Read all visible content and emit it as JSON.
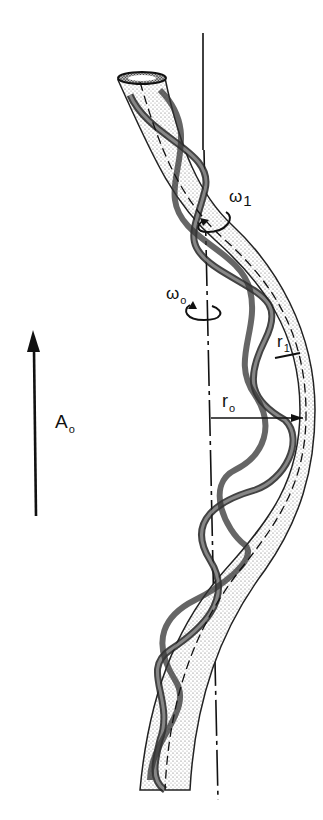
{
  "figure": {
    "labels": {
      "omega1": {
        "symbol": "ω",
        "subscript": "1"
      },
      "omega0": {
        "symbol": "ω",
        "subscript": "o"
      },
      "r1": {
        "symbol": "r",
        "subscript": "1"
      },
      "r0": {
        "symbol": "r",
        "subscript": "o"
      },
      "A0": {
        "symbol": "A",
        "subscript": "o"
      }
    },
    "colors": {
      "ink": "#111111",
      "stipple": "#555555",
      "background": "#ffffff"
    }
  }
}
